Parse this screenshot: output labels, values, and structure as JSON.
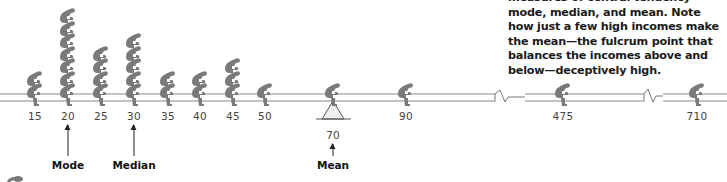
{
  "caption": {
    "text": "measures of central tendency—mode, median, and mean. Note how just a few high incomes make the mean—the fulcrum point that balances the incomes above and below—deceptively high."
  },
  "chart_data": {
    "type": "pictograph-seesaw",
    "title": "",
    "xlabel": "Income",
    "categories": [
      "15",
      "20",
      "25",
      "30",
      "35",
      "40",
      "45",
      "50",
      "70",
      "90",
      "475",
      "710"
    ],
    "values": [
      2,
      7,
      4,
      5,
      2,
      2,
      3,
      1,
      1,
      1,
      1,
      1
    ],
    "axis_breaks_between": [
      [
        "90",
        "475"
      ],
      [
        "475",
        "710"
      ]
    ],
    "annotations": [
      {
        "label": "Mode",
        "at": "20"
      },
      {
        "label": "Median",
        "at": "30"
      },
      {
        "label": "Mean",
        "at": "70",
        "note": "fulcrum"
      }
    ]
  },
  "axis": {
    "ticks": [
      {
        "label": "15",
        "x": 35
      },
      {
        "label": "20",
        "x": 68
      },
      {
        "label": "25",
        "x": 101
      },
      {
        "label": "30",
        "x": 134
      },
      {
        "label": "35",
        "x": 168
      },
      {
        "label": "40",
        "x": 200
      },
      {
        "label": "45",
        "x": 233
      },
      {
        "label": "50",
        "x": 265
      },
      {
        "label": "90",
        "x": 406
      },
      {
        "label": "475",
        "x": 563
      },
      {
        "label": "710",
        "x": 697
      }
    ],
    "mean_value": "70"
  },
  "measures": {
    "mode": "Mode",
    "median": "Median",
    "mean": "Mean"
  },
  "colors": {
    "figure": "#7a7a7a",
    "beam": "#888888",
    "text": "#1a1a1a"
  }
}
